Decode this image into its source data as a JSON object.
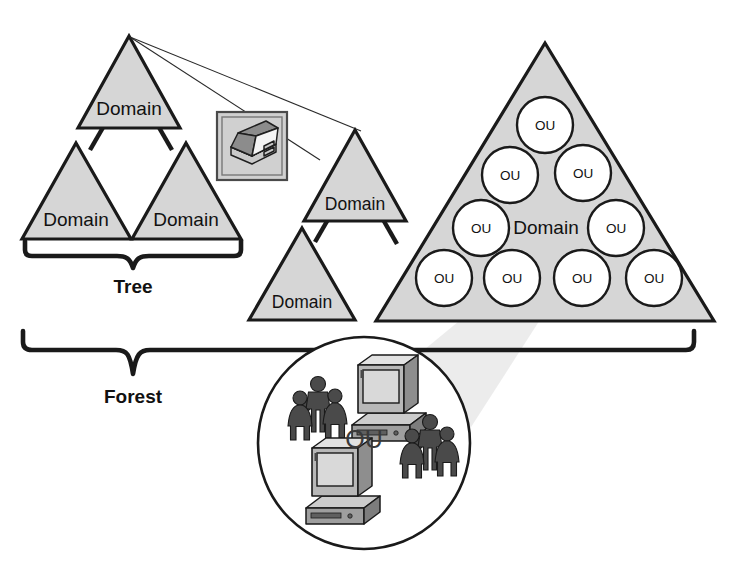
{
  "diagram": {
    "colors": {
      "triangle_fill": "#d6d6d6",
      "outline": "#1a1a1a",
      "circle_fill": "#ffffff",
      "spotlight": "#e9e9e9",
      "icon_frame": "#d0d0d0"
    },
    "labels": {
      "domain": "Domain",
      "ou": "OU",
      "tree": "Tree",
      "forest": "Forest"
    },
    "left_tree": {
      "name": "tree-one",
      "brace_label": "Tree",
      "domains": [
        {
          "id": "root",
          "label": "Domain"
        },
        {
          "id": "child-left",
          "label": "Domain"
        },
        {
          "id": "child-right",
          "label": "Domain"
        }
      ]
    },
    "middle_tree": {
      "name": "tree-two",
      "domains": [
        {
          "id": "root",
          "label": "Domain"
        },
        {
          "id": "child",
          "label": "Domain"
        }
      ]
    },
    "big_domain": {
      "name": "domain-with-ous",
      "label": "Domain",
      "ou_count": 10,
      "ous": [
        {
          "label": "OU",
          "row": 1,
          "col": 1
        },
        {
          "label": "OU",
          "row": 2,
          "col": 1
        },
        {
          "label": "OU",
          "row": 2,
          "col": 2
        },
        {
          "label": "OU",
          "row": 3,
          "col": 1
        },
        {
          "label": "OU",
          "row": 3,
          "col": 2
        },
        {
          "label": "OU",
          "row": 4,
          "col": 1
        },
        {
          "label": "OU",
          "row": 4,
          "col": 2
        },
        {
          "label": "OU",
          "row": 4,
          "col": 3
        },
        {
          "label": "OU",
          "row": 4,
          "col": 4
        }
      ]
    },
    "forest": {
      "brace_label": "Forest"
    },
    "ou_detail": {
      "name": "ou-detail-callout",
      "label": "OU",
      "contents": [
        {
          "kind": "people-group",
          "position": "upper-left"
        },
        {
          "kind": "computer",
          "position": "upper-right"
        },
        {
          "kind": "computer",
          "position": "lower-left"
        },
        {
          "kind": "people-group",
          "position": "lower-right"
        }
      ]
    },
    "book_icon": {
      "name": "book-icon",
      "description": "open book"
    }
  }
}
